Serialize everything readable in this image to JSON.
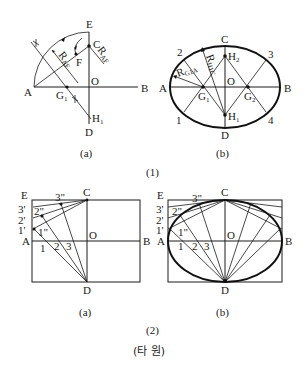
{
  "figure": {
    "title": "(타 원)",
    "colors": {
      "ink": "#1a1a1a",
      "background": "#ffffff"
    },
    "groups": [
      {
        "id": "1",
        "caption": "(1)",
        "panels": [
          {
            "id": "1a",
            "caption": "(a)",
            "labels": {
              "E": "E",
              "C": "C",
              "F": "F",
              "O": "O",
              "A": "A",
              "B": "B",
              "G1": "G",
              "G1_sub": "1",
              "H1": "H",
              "H1_sub": "1",
              "D": "D",
              "R1": "R",
              "R1_sub": "AF",
              "R2": "R",
              "R2_sub": "AF"
            }
          },
          {
            "id": "1b",
            "caption": "(b)",
            "labels": {
              "C": "C",
              "H2": "H",
              "H2_sub": "2",
              "n2": "2",
              "n3": "3",
              "A": "A",
              "O": "O",
              "B": "B",
              "G1": "G",
              "G1_sub": "1",
              "G2": "G",
              "G2_sub": "2",
              "n1": "1",
              "n4": "4",
              "H1": "H",
              "H1_sub": "1",
              "D": "D",
              "Rg": "R",
              "Rg_sub": "G1A",
              "Rh": "R",
              "Rh_sub": "H1C"
            }
          }
        ]
      },
      {
        "id": "2",
        "caption": "(2)",
        "panels": [
          {
            "id": "2a",
            "caption": "(a)",
            "labels": {
              "E": "E",
              "C": "C",
              "p3pp": "3\"",
              "p3p": "3'",
              "p2pp": "2\"",
              "p2p": "2'",
              "p1p": "1'",
              "p1pp": "1\"",
              "A": "A",
              "O": "O",
              "B": "B",
              "n1": "1",
              "n2": "2",
              "n3": "3",
              "D": "D"
            }
          },
          {
            "id": "2b",
            "caption": "(b)",
            "labels": {
              "E": "E",
              "C": "C",
              "p3pp": "3\"",
              "p3p": "3'",
              "p2pp": "2\"",
              "p2p": "2'",
              "p1p": "1'",
              "p1pp": "1\"",
              "A": "A",
              "O": "O",
              "B": "B",
              "n1": "1",
              "n2": "2",
              "n3": "3",
              "D": "D"
            }
          }
        ]
      }
    ]
  }
}
